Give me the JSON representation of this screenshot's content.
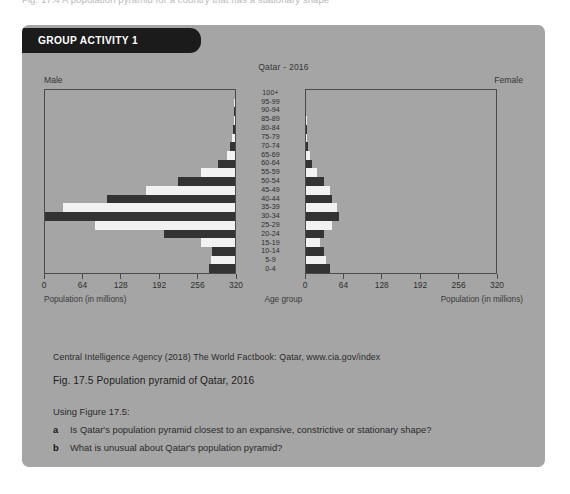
{
  "top_cutoff_text": "Fig. 17.4  A population pyramid for a country that has a stationary shape",
  "panel": {
    "banner_label": "GROUP ACTIVITY 1",
    "background_color": "#a5a5a5",
    "banner_color": "#1b1b1b"
  },
  "chart_data": {
    "type": "bar",
    "subtype": "population-pyramid",
    "title": "Qatar - 2016",
    "left_label": "Male",
    "right_label": "Female",
    "xlabel_left": "Population (in millions)",
    "xlabel_center": "Age group",
    "xlabel_right": "Population (in millions)",
    "ylabel": "Age group",
    "grid": false,
    "legend_position": "none",
    "xlim": [
      0,
      320
    ],
    "xticks": [
      0,
      64,
      128,
      192,
      256,
      320
    ],
    "xticklabels_left": [
      "320",
      "256",
      "192",
      "128",
      "64",
      "0"
    ],
    "xticklabels_right": [
      "0",
      "64",
      "128",
      "192",
      "256",
      "320"
    ],
    "categories": [
      "100+",
      "95-99",
      "90-94",
      "85-89",
      "80-84",
      "75-79",
      "70-74",
      "65-69",
      "60-64",
      "55-59",
      "50-54",
      "45-49",
      "40-44",
      "35-39",
      "30-34",
      "25-29",
      "20-24",
      "15-19",
      "10-14",
      "5-9",
      "0-4"
    ],
    "bar_colors": [
      "#333333",
      "#f2f2f2"
    ],
    "series": [
      {
        "name": "Male",
        "side": "left",
        "values": [
          0,
          1,
          1,
          2,
          3,
          5,
          8,
          14,
          28,
          58,
          96,
          150,
          215,
          290,
          320,
          235,
          120,
          58,
          38,
          40,
          44
        ]
      },
      {
        "name": "Female",
        "side": "right",
        "values": [
          0,
          0,
          0,
          1,
          1,
          2,
          3,
          6,
          10,
          18,
          30,
          40,
          44,
          52,
          55,
          44,
          30,
          24,
          30,
          34,
          40
        ]
      }
    ]
  },
  "source_line": "Central Intelligence Agency (2018) The World Factbook: Qatar, www.cia.gov/index",
  "figure_caption": "Fig. 17.5 Population pyramid of Qatar, 2016",
  "instruction": "Using Figure 17.5:",
  "questions": [
    {
      "marker": "a",
      "text": "Is Qatar's population pyramid closest to an expansive, constrictive or stationary shape?"
    },
    {
      "marker": "b",
      "text": "What is unusual about Qatar's population pyramid?"
    }
  ]
}
